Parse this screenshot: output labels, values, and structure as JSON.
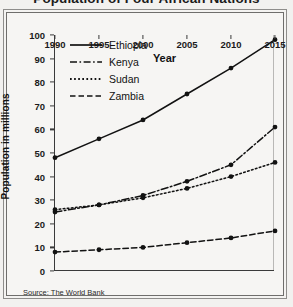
{
  "title": "Population of Four African Nations",
  "source_note": "Source: The World Bank",
  "axis": {
    "ylabel": "Population in millions",
    "xlabel": "Year",
    "yticks": [
      "0",
      "10",
      "20",
      "30",
      "40",
      "50",
      "60",
      "70",
      "80",
      "90",
      "100"
    ],
    "xticks": [
      "1990",
      "1995",
      "2000",
      "2005",
      "2010",
      "2015"
    ]
  },
  "legend": [
    {
      "label": "Ethiopia",
      "style": "solid"
    },
    {
      "label": "Kenya",
      "style": "dash-dot"
    },
    {
      "label": "Sudan",
      "style": "dotted"
    },
    {
      "label": "Zambia",
      "style": "dashed"
    }
  ],
  "chart_data": {
    "type": "line",
    "title": "Population of Four African Nations",
    "xlabel": "Year",
    "ylabel": "Population in millions",
    "x": [
      1990,
      1995,
      2000,
      2005,
      2010,
      2015
    ],
    "xlim": [
      1990,
      2015
    ],
    "ylim": [
      0,
      100
    ],
    "ytick_step": 10,
    "grid": false,
    "legend_position": "top-left-inside",
    "annotation": "Source: The World Bank",
    "series": [
      {
        "name": "Ethiopia",
        "style": "solid",
        "values": [
          48,
          56,
          64,
          75,
          86,
          98
        ]
      },
      {
        "name": "Kenya",
        "style": "dash-dot",
        "values": [
          25,
          28,
          32,
          38,
          45,
          61
        ]
      },
      {
        "name": "Sudan",
        "style": "dotted",
        "values": [
          26,
          28,
          31,
          35,
          40,
          46
        ]
      },
      {
        "name": "Zambia",
        "style": "dashed",
        "values": [
          8,
          9,
          10,
          12,
          14,
          17
        ]
      }
    ]
  }
}
